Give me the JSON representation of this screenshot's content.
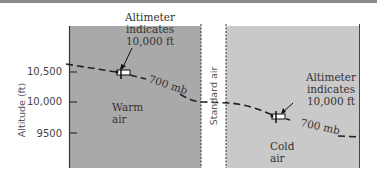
{
  "diagram": {
    "y_axis": {
      "label": "Altitude (ft)",
      "ticks": [
        "10,500",
        "10,000",
        "9500"
      ]
    },
    "panels": {
      "warm": {
        "label_line1": "Warm",
        "label_line2": "air",
        "color": "#a9a9a9"
      },
      "standard": {
        "label": "Standard air"
      },
      "cold": {
        "label_line1": "Cold",
        "label_line2": "air",
        "color": "#c9c9c9"
      }
    },
    "annotations": {
      "warm_altimeter": {
        "line1": "Altimeter",
        "line2": "indicates",
        "line3": "10,000 ft"
      },
      "cold_altimeter": {
        "line1": "Altimeter",
        "line2": "indicates",
        "line3": "10,000 ft"
      }
    },
    "pressure_line": {
      "warm_label": "700 mb",
      "cold_label": "700 mb"
    }
  }
}
